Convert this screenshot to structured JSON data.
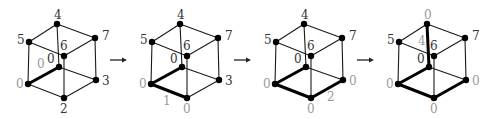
{
  "diagram": {
    "type": "cube-sequence",
    "vertex_layout": {
      "front_left": [
        0,
        60
      ],
      "back_bottom": [
        31,
        43
      ],
      "front_bottom": [
        36,
        74
      ],
      "right_bottom": [
        68,
        56
      ],
      "top_left": [
        1,
        18
      ],
      "top_back": [
        29,
        0
      ],
      "top_front": [
        36,
        32
      ],
      "top_right": [
        67,
        14
      ]
    },
    "edges": [
      [
        "front_left",
        "back_bottom"
      ],
      [
        "front_left",
        "front_bottom"
      ],
      [
        "front_bottom",
        "right_bottom"
      ],
      [
        "back_bottom",
        "right_bottom"
      ],
      [
        "front_left",
        "top_left"
      ],
      [
        "back_bottom",
        "top_back"
      ],
      [
        "front_bottom",
        "top_front"
      ],
      [
        "right_bottom",
        "top_right"
      ],
      [
        "top_left",
        "top_back"
      ],
      [
        "top_left",
        "top_front"
      ],
      [
        "top_back",
        "top_right"
      ],
      [
        "top_front",
        "top_right"
      ]
    ],
    "cubes": [
      {
        "offset_x": 28,
        "offset_y": 24,
        "thick_edges": [
          [
            "front_left",
            "back_bottom"
          ]
        ],
        "labels": {
          "top_back": {
            "text": "4",
            "gray": false
          },
          "top_left": {
            "text": "5",
            "gray": false
          },
          "top_right": {
            "text": "7",
            "gray": false
          },
          "top_front": {
            "text": "6",
            "gray": false
          },
          "back_bottom": {
            "text": "0",
            "gray": false
          },
          "front_left": {
            "text": "0",
            "gray": true
          },
          "right_bottom": {
            "text": "3",
            "gray": false
          },
          "front_bottom": {
            "text": "2",
            "gray": false
          }
        },
        "edge_label": {
          "text": "0",
          "edge": [
            "front_left",
            "back_bottom"
          ],
          "dx": 9,
          "dy": 44
        }
      },
      {
        "offset_x": 151,
        "offset_y": 24,
        "thick_edges": [
          [
            "front_left",
            "back_bottom"
          ],
          [
            "front_left",
            "front_bottom"
          ]
        ],
        "labels": {
          "top_back": {
            "text": "4",
            "gray": false
          },
          "top_left": {
            "text": "5",
            "gray": false
          },
          "top_right": {
            "text": "7",
            "gray": false
          },
          "top_front": {
            "text": "6",
            "gray": false
          },
          "back_bottom": {
            "text": "0",
            "gray": false
          },
          "front_left": {
            "text": "0",
            "gray": true
          },
          "right_bottom": {
            "text": "3",
            "gray": false
          },
          "front_bottom": {
            "text": "0",
            "gray": true
          }
        },
        "edge_label": {
          "text": "1",
          "edge": [
            "front_left",
            "front_bottom"
          ],
          "dx": 12,
          "dy": 81
        }
      },
      {
        "offset_x": 275,
        "offset_y": 24,
        "thick_edges": [
          [
            "front_left",
            "back_bottom"
          ],
          [
            "front_left",
            "front_bottom"
          ],
          [
            "front_bottom",
            "right_bottom"
          ]
        ],
        "labels": {
          "top_back": {
            "text": "4",
            "gray": false
          },
          "top_left": {
            "text": "5",
            "gray": false
          },
          "top_right": {
            "text": "7",
            "gray": false
          },
          "top_front": {
            "text": "6",
            "gray": false
          },
          "back_bottom": {
            "text": "0",
            "gray": false
          },
          "front_left": {
            "text": "0",
            "gray": true
          },
          "right_bottom": {
            "text": "0",
            "gray": true
          },
          "front_bottom": {
            "text": "0",
            "gray": true
          }
        },
        "edge_label": {
          "text": "2",
          "edge": [
            "front_bottom",
            "right_bottom"
          ],
          "dx": 52,
          "dy": 77
        }
      },
      {
        "offset_x": 398,
        "offset_y": 24,
        "thick_edges": [
          [
            "front_left",
            "back_bottom"
          ],
          [
            "front_left",
            "front_bottom"
          ],
          [
            "front_bottom",
            "right_bottom"
          ],
          [
            "back_bottom",
            "top_back"
          ]
        ],
        "labels": {
          "top_back": {
            "text": "0",
            "gray": true
          },
          "top_left": {
            "text": "5",
            "gray": false
          },
          "top_right": {
            "text": "7",
            "gray": false
          },
          "top_front": {
            "text": "6",
            "gray": false
          },
          "back_bottom": {
            "text": "0",
            "gray": false
          },
          "front_left": {
            "text": "0",
            "gray": true
          },
          "right_bottom": {
            "text": "0",
            "gray": true
          },
          "front_bottom": {
            "text": "0",
            "gray": true
          }
        },
        "edge_label": {
          "text": "4",
          "edge": [
            "back_bottom",
            "top_back"
          ],
          "dx": 20,
          "dy": 21
        }
      }
    ],
    "arrows": [
      {
        "x1": 110,
        "x2": 127,
        "y": 60
      },
      {
        "x1": 234,
        "x2": 251,
        "y": 60
      },
      {
        "x1": 357,
        "x2": 374,
        "y": 60
      }
    ],
    "label_offsets": {
      "top_back": [
        -3,
        -5
      ],
      "top_left": [
        -12,
        2
      ],
      "top_right": [
        7,
        2
      ],
      "top_front": [
        -4,
        -6
      ],
      "back_bottom": [
        -12,
        -4
      ],
      "front_left": [
        -12,
        4
      ],
      "right_bottom": [
        6,
        5
      ],
      "front_bottom": [
        -4,
        15
      ]
    }
  }
}
